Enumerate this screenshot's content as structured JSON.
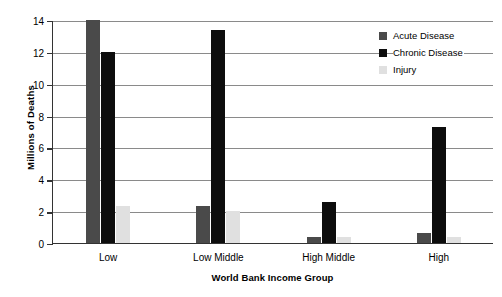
{
  "chart_data": {
    "type": "bar",
    "title": "",
    "xlabel": "World Bank Income Group",
    "ylabel": "Millions of Deaths",
    "categories": [
      "Low",
      "Low Middle",
      "High Middle",
      "High"
    ],
    "series": [
      {
        "name": "Acute Disease",
        "color": "#4a4a4a",
        "values": [
          14.0,
          2.3,
          0.4,
          0.6
        ]
      },
      {
        "name": "Chronic Disease",
        "color": "#0d0d0d",
        "values": [
          12.0,
          13.35,
          2.55,
          7.3
        ]
      },
      {
        "name": "Injury",
        "color": "#e0e0e0",
        "values": [
          2.3,
          2.0,
          0.35,
          0.4
        ]
      }
    ],
    "ylim": [
      0,
      14
    ],
    "yticks": [
      0,
      2,
      4,
      6,
      8,
      10,
      12,
      14
    ],
    "ytick_labels": [
      "0",
      "2",
      "4",
      "6",
      "8",
      "10",
      "12",
      "14"
    ],
    "grid": true,
    "legend_position": "top-right"
  }
}
